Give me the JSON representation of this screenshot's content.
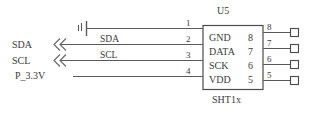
{
  "diagram": {
    "type": "schematic",
    "title_ref": "U5",
    "part_number": "SHT1x",
    "component": {
      "reference": "U5",
      "part": "SHT1x",
      "pins_left": [
        {
          "number": "1"
        },
        {
          "number": "2"
        },
        {
          "number": "3"
        },
        {
          "number": "4"
        }
      ],
      "pin_names": [
        {
          "name": "GND",
          "number": "8"
        },
        {
          "name": "DATA",
          "number": "7"
        },
        {
          "name": "SCK",
          "number": "6"
        },
        {
          "name": "VDD",
          "number": "5"
        }
      ],
      "pins_right": [
        {
          "number": "8"
        },
        {
          "number": "7"
        },
        {
          "number": "6"
        },
        {
          "number": "5"
        }
      ]
    },
    "nets_left": [
      {
        "label": "SDA"
      },
      {
        "label": "SCL"
      },
      {
        "label": "P_3.3V"
      }
    ],
    "wire_labels": [
      {
        "label": "SDA"
      },
      {
        "label": "SCL"
      }
    ],
    "symbols": {
      "ground": "chassis-ground-icon",
      "break_marks": "net-break-icon",
      "test_pads": "square-pad-icon"
    },
    "colors": {
      "line": "#4a4a4a",
      "text": "#3a3a3a",
      "background": "#ffffff"
    }
  }
}
